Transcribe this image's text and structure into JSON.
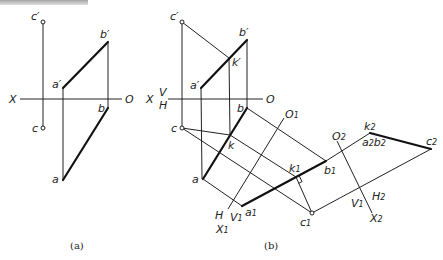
{
  "header": {
    "cropped_text": ""
  },
  "figure_a": {
    "caption": "(a)",
    "axis": {
      "left": "X",
      "right": "O"
    },
    "points": {
      "c_prime": "c′",
      "b_prime": "b′",
      "a_prime": "a′",
      "b": "b",
      "c": "c",
      "a": "a"
    }
  },
  "figure_b": {
    "caption": "(b)",
    "axis": {
      "left": "X",
      "V": "V",
      "H": "H",
      "right": "O"
    },
    "points": {
      "c_prime": "c′",
      "b_prime": "b′",
      "k_prime": "k′",
      "a_prime": "a′",
      "b": "b",
      "c": "c",
      "k": "k",
      "a": "a",
      "a1": "a",
      "a1_sub": "1",
      "b1": "b",
      "b1_sub": "1",
      "k1": "k",
      "k1_sub": "1",
      "c1": "c",
      "c1_sub": "1",
      "k2": "k",
      "k2_sub": "2",
      "a2b2": "a",
      "a2b2_sub1": "2",
      "a2b2_mid": "b",
      "a2b2_sub2": "2",
      "c2": "c",
      "c2_sub": "2"
    },
    "axis1": {
      "O": "O",
      "O_sub": "1",
      "H": "H",
      "V": "V",
      "V_sub": "1",
      "X": "X",
      "X_sub": "1"
    },
    "axis2": {
      "O": "O",
      "O_sub": "2",
      "V": "V",
      "V_sub": "1",
      "H": "H",
      "H_sub": "2",
      "X": "X",
      "X_sub": "2"
    }
  }
}
